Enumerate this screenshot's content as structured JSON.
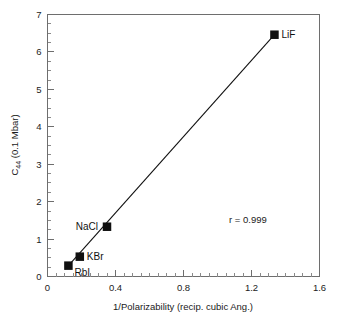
{
  "chart_data": {
    "type": "scatter",
    "title": "",
    "xlabel": "1/Polarizability (recip. cubic Ang.)",
    "ylabel_main": "C",
    "ylabel_sub": "44",
    "ylabel_tail": " (0.1 Mbar)",
    "ylabel_full": "C44 (0.1 Mbar)",
    "xlim": [
      0,
      1.6
    ],
    "ylim": [
      0,
      7
    ],
    "x_major_ticks": [
      0,
      0.4,
      0.8,
      1.2,
      1.6
    ],
    "x_major_tick_labels": [
      "0",
      "0.4",
      "0.8",
      "1.2",
      "1.6"
    ],
    "x_minor_step": 0.05,
    "y_major_ticks": [
      0,
      1,
      2,
      3,
      4,
      5,
      6,
      7
    ],
    "y_major_tick_labels": [
      "0",
      "1",
      "2",
      "3",
      "4",
      "5",
      "6",
      "7"
    ],
    "y_minor_step": 0.25,
    "grid": false,
    "legend": "none",
    "marker_shape": "square",
    "marker_color": "#101010",
    "line_color": "#111111",
    "points": [
      {
        "label": "RbI",
        "x": 0.123,
        "y": 0.29,
        "label_pos": "below-right"
      },
      {
        "label": "KBr",
        "x": 0.19,
        "y": 0.53,
        "label_pos": "right"
      },
      {
        "label": "NaCl",
        "x": 0.35,
        "y": 1.33,
        "label_pos": "left"
      },
      {
        "label": "LiF",
        "x": 1.335,
        "y": 6.46,
        "label_pos": "right"
      }
    ],
    "fit_line": {
      "x1": 0.105,
      "y1": 0.2,
      "x2": 1.335,
      "y2": 6.46
    },
    "annotations": [
      {
        "name": "correlation",
        "text": "r = 0.999",
        "x": 1.29,
        "y": 1.42
      }
    ]
  }
}
